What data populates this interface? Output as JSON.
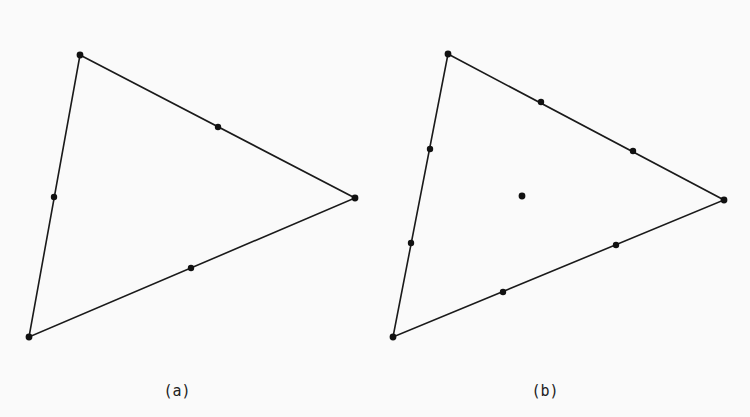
{
  "figure": {
    "panels": [
      {
        "id": "a",
        "caption": "(a)",
        "element_type": "6-node quadratic triangle",
        "nodes": {
          "vertices": 3,
          "edge_nodes_per_edge": 1,
          "interior_nodes": 0,
          "total": 6
        }
      },
      {
        "id": "b",
        "caption": "(b)",
        "element_type": "10-node cubic triangle",
        "nodes": {
          "vertices": 3,
          "edge_nodes_per_edge": 2,
          "interior_nodes": 1,
          "total": 10
        }
      }
    ]
  },
  "colors": {
    "background": "#fafafa",
    "ink": "#111111"
  }
}
